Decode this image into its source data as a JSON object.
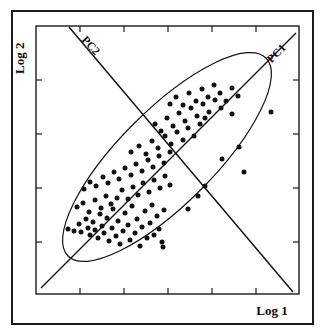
{
  "figure": {
    "background_color": "#ffffff",
    "ink_color": "#141414",
    "outer_border": {
      "x": 12,
      "y": 11,
      "width": 301,
      "height": 313,
      "stroke_width": 2.0
    },
    "plot_frame": {
      "x": 36,
      "y": 26,
      "width": 263,
      "height": 268,
      "stroke_width": 1.4
    }
  },
  "axes": {
    "x_axis": {
      "label": "Log 1",
      "label_x": 272,
      "label_y": 315,
      "tick_count": 5,
      "tick_length": 6,
      "tick_positions": [
        80,
        124,
        168,
        212,
        256
      ],
      "ticks_top": true,
      "ticks_bottom": true
    },
    "y_axis": {
      "label": "Log 2",
      "label_x": 24,
      "label_y": 74,
      "label_rotation": -90,
      "tick_count": 4,
      "tick_length": 6,
      "tick_positions": [
        80,
        134,
        188,
        242
      ],
      "ticks_left": true,
      "ticks_right": true
    }
  },
  "chart_data": {
    "type": "scatter",
    "title": "",
    "xlabel": "Log 1",
    "ylabel": "Log 2",
    "xlim": [
      0,
      100
    ],
    "ylim": [
      0,
      100
    ],
    "grid": false,
    "legend": false,
    "tick_labels_x": [],
    "tick_labels_y": [],
    "annotations": [
      {
        "text": "PC1",
        "kind": "principal-component-axis",
        "angle_deg": -45,
        "x": 279,
        "y": 56,
        "line": {
          "x1": 41,
          "y1": 288,
          "x2": 296,
          "y2": 33
        }
      },
      {
        "text": "PC2",
        "kind": "principal-component-axis",
        "angle_deg": 48,
        "x": 88,
        "y": 48,
        "line": {
          "x1": 69,
          "y1": 27,
          "x2": 293,
          "y2": 292
        }
      }
    ],
    "ellipse": {
      "kind": "confidence-ellipse",
      "center_x": 167,
      "center_y": 157,
      "semi_major": 140,
      "semi_minor": 47,
      "rotation_deg": -45,
      "stroke_width": 1.2,
      "fill": "none"
    },
    "marker": {
      "shape": "circle",
      "radius": 2.5,
      "color": "#111111"
    },
    "n_points": 112,
    "points": [
      [
        68,
        229
      ],
      [
        74,
        231
      ],
      [
        79,
        224
      ],
      [
        81,
        232
      ],
      [
        86,
        219
      ],
      [
        88,
        228
      ],
      [
        90,
        235
      ],
      [
        93,
        222
      ],
      [
        95,
        230
      ],
      [
        98,
        238
      ],
      [
        100,
        214
      ],
      [
        102,
        226
      ],
      [
        104,
        233
      ],
      [
        107,
        218
      ],
      [
        109,
        241
      ],
      [
        112,
        228
      ],
      [
        113,
        209
      ],
      [
        116,
        236
      ],
      [
        118,
        221
      ],
      [
        120,
        244
      ],
      [
        123,
        231
      ],
      [
        125,
        213
      ],
      [
        128,
        225
      ],
      [
        130,
        240
      ],
      [
        132,
        206
      ],
      [
        135,
        233
      ],
      [
        137,
        219
      ],
      [
        140,
        246
      ],
      [
        142,
        227
      ],
      [
        145,
        211
      ],
      [
        147,
        238
      ],
      [
        150,
        223
      ],
      [
        152,
        205
      ],
      [
        154,
        235
      ],
      [
        157,
        216
      ],
      [
        159,
        229
      ],
      [
        162,
        242
      ],
      [
        164,
        210
      ],
      [
        77,
        207
      ],
      [
        83,
        203
      ],
      [
        89,
        212
      ],
      [
        95,
        200
      ],
      [
        101,
        208
      ],
      [
        106,
        196
      ],
      [
        111,
        204
      ],
      [
        117,
        198
      ],
      [
        122,
        190
      ],
      [
        128,
        199
      ],
      [
        133,
        187
      ],
      [
        138,
        195
      ],
      [
        143,
        183
      ],
      [
        149,
        192
      ],
      [
        154,
        180
      ],
      [
        160,
        188
      ],
      [
        165,
        176
      ],
      [
        170,
        185
      ],
      [
        84,
        189
      ],
      [
        90,
        182
      ],
      [
        96,
        186
      ],
      [
        103,
        177
      ],
      [
        108,
        183
      ],
      [
        114,
        172
      ],
      [
        119,
        179
      ],
      [
        125,
        168
      ],
      [
        131,
        175
      ],
      [
        136,
        164
      ],
      [
        142,
        171
      ],
      [
        148,
        160
      ],
      [
        153,
        167
      ],
      [
        159,
        156
      ],
      [
        164,
        163
      ],
      [
        170,
        152
      ],
      [
        131,
        152
      ],
      [
        139,
        146
      ],
      [
        146,
        154
      ],
      [
        152,
        141
      ],
      [
        158,
        148
      ],
      [
        165,
        136
      ],
      [
        171,
        144
      ],
      [
        177,
        132
      ],
      [
        183,
        140
      ],
      [
        188,
        128
      ],
      [
        194,
        136
      ],
      [
        200,
        124
      ],
      [
        155,
        124
      ],
      [
        161,
        131
      ],
      [
        167,
        118
      ],
      [
        173,
        126
      ],
      [
        179,
        113
      ],
      [
        185,
        121
      ],
      [
        191,
        108
      ],
      [
        197,
        116
      ],
      [
        203,
        104
      ],
      [
        209,
        112
      ],
      [
        215,
        100
      ],
      [
        221,
        108
      ],
      [
        170,
        104
      ],
      [
        176,
        97
      ],
      [
        183,
        105
      ],
      [
        189,
        93
      ],
      [
        196,
        101
      ],
      [
        202,
        89
      ],
      [
        208,
        97
      ],
      [
        214,
        85
      ],
      [
        220,
        93
      ],
      [
        226,
        101
      ],
      [
        232,
        88
      ],
      [
        238,
        96
      ],
      [
        205,
        118
      ],
      [
        232,
        114
      ],
      [
        239,
        147
      ],
      [
        222,
        159
      ],
      [
        244,
        172
      ],
      [
        271,
        112
      ],
      [
        198,
        196
      ],
      [
        205,
        186
      ],
      [
        188,
        209
      ],
      [
        163,
        247
      ]
    ]
  }
}
